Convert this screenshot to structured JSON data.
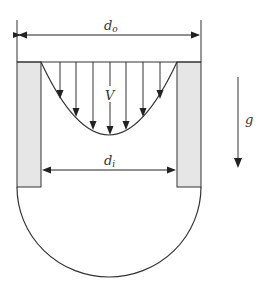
{
  "diagram": {
    "labels": {
      "outer_diameter": "d",
      "outer_diameter_sub": "o",
      "inner_diameter": "d",
      "inner_diameter_sub": "i",
      "velocity": "V",
      "gravity": "g"
    },
    "colors": {
      "line": "#333333",
      "wall_fill": "#e6e6e6",
      "background": "#ffffff"
    },
    "velocity_arrows_x": [
      60,
      76,
      93,
      110,
      126,
      143,
      160
    ]
  }
}
